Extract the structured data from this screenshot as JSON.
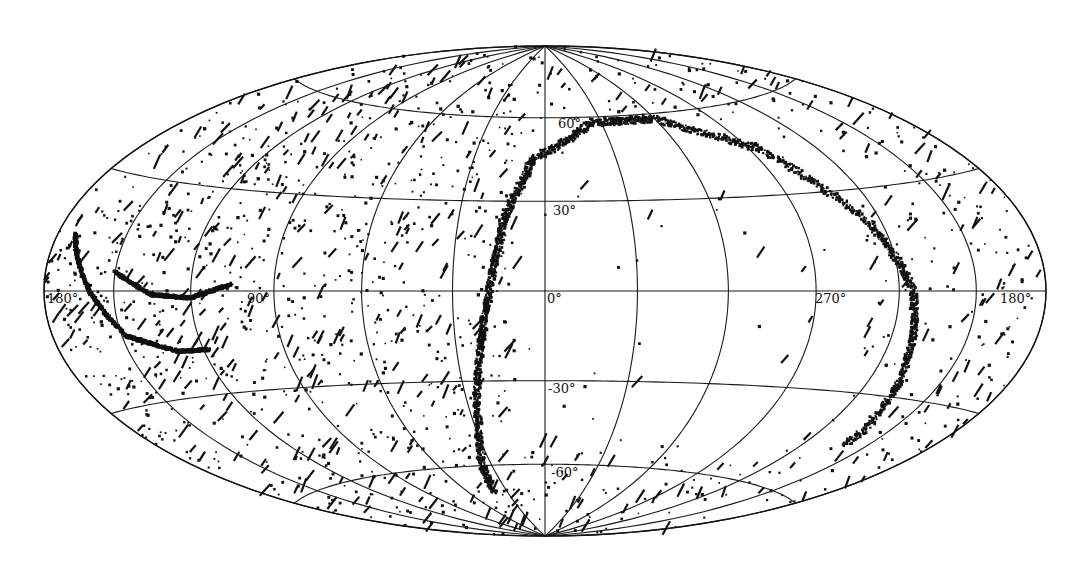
{
  "chart_data": {
    "type": "scatter",
    "projection": "aitoff-hammer (full-sky, equal-area ellipse)",
    "title": "",
    "xlabel": "longitude",
    "ylabel": "latitude",
    "grid": true,
    "meridian_step_deg": 30,
    "parallels_deg": [
      -60,
      -30,
      0,
      30,
      60
    ],
    "longitude_direction": "increasing to the left (180 at left edge, 0 at centre, 270 right of centre, 180 at right edge)",
    "lon_tick_labels": [
      {
        "text": "180°",
        "lon": 180,
        "side": "left"
      },
      {
        "text": "90°",
        "lon": 90
      },
      {
        "text": "0°",
        "lon": 0
      },
      {
        "text": "270°",
        "lon": 270
      },
      {
        "text": "180°",
        "lon": 180,
        "side": "right"
      }
    ],
    "lat_tick_labels": [
      {
        "text": "60°",
        "lat": 60
      },
      {
        "text": "30°",
        "lat": 30
      },
      {
        "text": "-30°",
        "lat": -30
      },
      {
        "text": "-60°",
        "lat": -60
      }
    ],
    "series": [
      {
        "name": "scattered background sources",
        "kind": "uniform-scatter",
        "count": 1500,
        "note": "dense over left (lon 0..180) hemisphere and outer rim, sparse in central-right region"
      },
      {
        "name": "great-circle arc (bright band through 0°)",
        "kind": "arc",
        "points_lonlat": [
          [
            40,
            -70
          ],
          [
            28,
            -45
          ],
          [
            22,
            -20
          ],
          [
            18,
            0
          ],
          [
            14,
            25
          ],
          [
            5,
            45
          ],
          [
            -25,
            58
          ],
          [
            -60,
            58
          ],
          [
            -95,
            45
          ],
          [
            -115,
            20
          ],
          [
            -125,
            0
          ],
          [
            -130,
            -20
          ],
          [
            -140,
            -45
          ]
        ]
      },
      {
        "name": "arc segment (left, upper)",
        "kind": "arc",
        "points_lonlat": [
          [
            150,
            5
          ],
          [
            135,
            -1
          ],
          [
            120,
            -2
          ],
          [
            105,
            2
          ]
        ]
      },
      {
        "name": "arc segment (left, lower)",
        "kind": "arc",
        "points_lonlat": [
          [
            172,
            14
          ],
          [
            160,
            0
          ],
          [
            148,
            -12
          ],
          [
            130,
            -17
          ],
          [
            118,
            -17
          ]
        ]
      }
    ]
  },
  "labels": {
    "lon_180_left": "180°",
    "lon_90": "90°",
    "lon_0": "0°",
    "lon_270": "270°",
    "lon_180_right": "180°",
    "lat_60": "60°",
    "lat_30": "30°",
    "lat_m30": "-30°",
    "lat_m60": "-60°"
  },
  "geometry": {
    "cx": 545,
    "cy": 291,
    "a": 501,
    "b": 245
  }
}
